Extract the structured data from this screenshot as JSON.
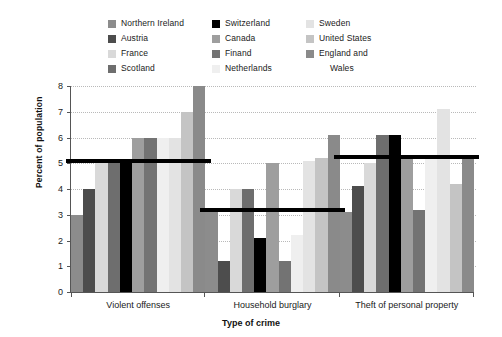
{
  "chart_data": {
    "type": "bar",
    "title": "",
    "subtitle": "",
    "xlabel": "Type of crime",
    "ylabel": "Percent of population",
    "categories": [
      "Violent offenses",
      "Household burglary",
      "Theft of personal property"
    ],
    "ylim": [
      0,
      8
    ],
    "yticks": [
      "0",
      "1",
      "2",
      "3",
      "4",
      "5",
      "6",
      "7",
      "8"
    ],
    "grid": true,
    "legend_position": "top",
    "series": [
      {
        "name": "Northern Ireland",
        "color": "#8c8c8c",
        "values": [
          3.0,
          3.1,
          3.1
        ]
      },
      {
        "name": "Austria",
        "color": "#4d4d4d",
        "values": [
          4.0,
          1.2,
          4.1
        ]
      },
      {
        "name": "France",
        "color": "#d9d9d9",
        "values": [
          5.0,
          4.0,
          5.0
        ]
      },
      {
        "name": "Scotland",
        "color": "#6e6e6e",
        "values": [
          5.0,
          4.0,
          6.1
        ]
      },
      {
        "name": "Switzerland",
        "color": "#000000",
        "values": [
          5.0,
          2.1,
          6.1
        ]
      },
      {
        "name": "Canada",
        "color": "#9e9e9e",
        "values": [
          6.0,
          5.0,
          5.2
        ]
      },
      {
        "name": "Finand",
        "color": "#737373",
        "values": [
          6.0,
          1.2,
          3.2
        ]
      },
      {
        "name": "Netherlands",
        "color": "#efefef",
        "values": [
          6.0,
          2.2,
          5.2
        ]
      },
      {
        "name": "Sweden",
        "color": "#e3e3e3",
        "values": [
          6.0,
          5.1,
          7.1
        ]
      },
      {
        "name": "United States",
        "color": "#c4c4c4",
        "values": [
          7.0,
          5.2,
          4.2
        ]
      },
      {
        "name": "England and\nWales",
        "color": "#8a8a8a",
        "values": [
          8.0,
          6.1,
          5.2
        ]
      }
    ],
    "mean_lines": [
      {
        "category": "Violent offenses",
        "value": 5.0
      },
      {
        "category": "Household burglary",
        "value": 3.1
      },
      {
        "category": "Theft of personal property",
        "value": 5.15
      }
    ]
  },
  "legend": {
    "columns": [
      {
        "entries": [
          "Northern Ireland",
          "Austria",
          "France",
          "Scotland"
        ]
      },
      {
        "entries": [
          "Switzerland",
          "Canada",
          "Finand",
          "Netherlands"
        ]
      },
      {
        "entries": [
          "Sweden",
          "United States",
          "England and",
          "Wales"
        ]
      }
    ]
  }
}
